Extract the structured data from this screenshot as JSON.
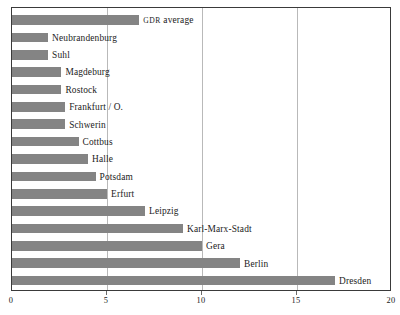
{
  "chart_data": {
    "type": "bar",
    "orientation": "horizontal",
    "title": "",
    "subtitle": "",
    "xlabel": "",
    "ylabel": "",
    "xlim": [
      0,
      20
    ],
    "xticks": [
      0,
      5,
      10,
      15,
      20
    ],
    "xtick_labels": [
      "0",
      "5",
      "10",
      "15",
      "20"
    ],
    "grid": "vertical",
    "legend": "none",
    "bar_color": "#848484",
    "frame_color": "#3a3a3a",
    "gridline_color": "#b9b9b9",
    "categories": [
      "GDR average",
      "Neubrandenburg",
      "Suhl",
      "Magdeburg",
      "Rostock",
      "Frankfurt / O.",
      "Schwerin",
      "Cottbus",
      "Halle",
      "Potsdam",
      "Erfurt",
      "Leipzig",
      "Karl-Marx-Stadt",
      "Gera",
      "Berlin",
      "Dresden"
    ],
    "values": [
      6.7,
      1.9,
      1.9,
      2.6,
      2.6,
      2.8,
      2.8,
      3.5,
      4.0,
      4.4,
      5.0,
      7.0,
      9.0,
      10.0,
      12.0,
      17.0
    ],
    "bars": [
      {
        "label": "GDR average",
        "label_html": "<span class=\"smallcaps\">GDR</span> average",
        "value": 6.7,
        "smallcaps_prefix": "GDR",
        "rest": " average"
      },
      {
        "label": "Neubrandenburg",
        "value": 1.9
      },
      {
        "label": "Suhl",
        "value": 1.9
      },
      {
        "label": "Magdeburg",
        "value": 2.6
      },
      {
        "label": "Rostock",
        "value": 2.6
      },
      {
        "label": "Frankfurt / O.",
        "value": 2.8
      },
      {
        "label": "Schwerin",
        "value": 2.8
      },
      {
        "label": "Cottbus",
        "value": 3.5
      },
      {
        "label": "Halle",
        "value": 4.0
      },
      {
        "label": "Potsdam",
        "value": 4.4
      },
      {
        "label": "Erfurt",
        "value": 5.0
      },
      {
        "label": "Leipzig",
        "value": 7.0
      },
      {
        "label": "Karl-Marx-Stadt",
        "value": 9.0
      },
      {
        "label": "Gera",
        "value": 10.0
      },
      {
        "label": "Berlin",
        "value": 12.0
      },
      {
        "label": "Dresden",
        "value": 17.0
      }
    ]
  }
}
